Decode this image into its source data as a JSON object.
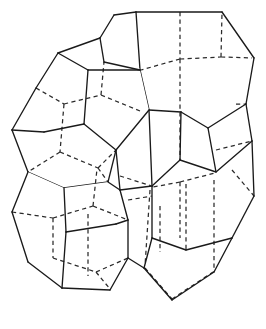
{
  "figure": {
    "type": "line-drawing",
    "domain": "geometry-diagram",
    "background_color": "#ffffff",
    "solid_edge_color": "#1a1a1a",
    "dashed_edge_color": "#2a2a2a",
    "solid_edge_width": 1.35,
    "dashed_edge_width": 1.25,
    "dash_pattern": "4.2 3.4",
    "canvas": {
      "width": 266,
      "height": 329
    },
    "caption": "",
    "polyhedra_count": 4,
    "polyhedra": [
      {
        "name": "upper-left-dodecahedron",
        "label": "A",
        "center_x": 96,
        "center_y": 105,
        "radius": 80,
        "visible_edges": [
          "M 12,130 L 36,88",
          "M 36,88 L 58,53",
          "M 58,53 L 100,38",
          "M 100,38 L 114,15",
          "M 58,53 L 88,70",
          "M 88,70 L 140,70",
          "M 140,70 L 151,42",
          "M 88,70 L 82,124",
          "M 12,130 L 44,132",
          "M 12,130 L 28,172",
          "M 28,172 L 64,188",
          "M 64,188 L 108,182",
          "M 108,182 L 116,150",
          "M 140,70 L 149,110",
          "M 44,132 L 82,124"
        ],
        "hidden_edges": [
          "M 36,88 L 62,105",
          "M 62,105 L 100,96",
          "M 100,96 L 104,60",
          "M 62,105 L 58,152",
          "M 58,152 L 96,168",
          "M 96,168 L 116,150",
          "M 100,96 L 140,112"
        ]
      },
      {
        "name": "upper-right-dodecahedron",
        "label": "B",
        "center_x": 186,
        "center_y": 92,
        "radius": 82,
        "visible_edges": [
          "M 136,12 L 222,12",
          "M 222,12 L 254,58",
          "M 254,58 L 246,104",
          "M 246,104 L 208,128",
          "M 208,128 L 181,112",
          "M 181,112 L 149,110",
          "M 149,110 L 140,70",
          "M 140,70 L 136,12",
          "M 181,112 L 180,160",
          "M 246,104 L 252,140",
          "M 208,128 L 216,172"
        ],
        "hidden_edges": [
          "M 180,12 L 180,60",
          "M 180,60 L 140,70",
          "M 180,60 L 222,58",
          "M 222,58 L 222,12",
          "M 222,58 L 254,58",
          "M 180,60 L 180,160"
        ]
      },
      {
        "name": "lower-left-dodecahedron",
        "label": "C",
        "center_x": 92,
        "center_y": 244,
        "radius": 80,
        "visible_edges": [
          "M 28,172 L 12,212",
          "M 12,212 L 28,262",
          "M 28,262 L 62,288",
          "M 62,288 L 110,290",
          "M 110,290 L 128,258",
          "M 128,258 L 116,224",
          "M 116,224 L 120,190",
          "M 64,188 L 66,232",
          "M 66,232 L 116,224",
          "M 66,232 L 62,288",
          "M 64,188 L 28,172",
          "M 108,182 L 120,190",
          "M 120,190 L 152,186"
        ],
        "hidden_edges": [
          "M 12,212 L 52,218",
          "M 52,218 L 92,206",
          "M 92,206 L 96,168",
          "M 52,218 L 52,258",
          "M 52,258 L 96,272",
          "M 96,272 L 110,290",
          "M 92,206 L 128,220",
          "M 96,272 L 128,258"
        ]
      },
      {
        "name": "lower-right-dodecahedron",
        "label": "D",
        "center_x": 188,
        "center_y": 242,
        "radius": 80,
        "visible_edges": [
          "M 180,160 L 216,172",
          "M 216,172 L 252,140",
          "M 252,140 L 254,196",
          "M 254,196 L 232,238",
          "M 232,238 L 186,250",
          "M 186,250 L 152,238",
          "M 152,238 L 152,186",
          "M 152,186 L 180,160",
          "M 152,238 L 144,268",
          "M 144,268 L 172,300",
          "M 172,300 L 214,272",
          "M 214,272 L 232,238"
        ],
        "hidden_edges": [
          "M 180,182 L 180,238",
          "M 180,182 L 152,186",
          "M 180,182 L 216,172",
          "M 150,190 L 144,268",
          "M 214,180 L 214,272",
          "M 144,268 L 172,300",
          "M 172,300 L 214,272"
        ]
      }
    ]
  }
}
